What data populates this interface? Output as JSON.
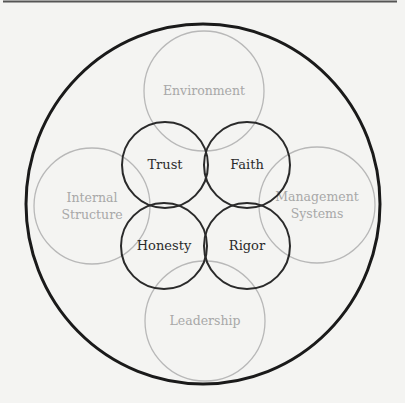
{
  "diagram": {
    "colors": {
      "background": "#f4f4f2",
      "outer_stroke": "#1a1a1a",
      "outer_label_stroke": "#b8b8b8",
      "outer_label_text": "#a8a8a8",
      "inner_stroke": "#2a2a2a",
      "inner_text": "#2a2a2a",
      "top_rule": "#555555"
    },
    "outer_ring": {
      "cx": 203,
      "cy": 204,
      "rx": 177,
      "ry": 180
    },
    "outer_circles": [
      {
        "id": "environment",
        "lines": [
          "Environment"
        ],
        "cx": 204,
        "cy": 91,
        "r": 60
      },
      {
        "id": "internal-structure",
        "lines": [
          "Internal",
          "Structure"
        ],
        "cx": 92,
        "cy": 206,
        "r": 58
      },
      {
        "id": "management-systems",
        "lines": [
          "Management",
          "Systems"
        ],
        "cx": 317,
        "cy": 205,
        "r": 58
      },
      {
        "id": "leadership",
        "lines": [
          "Leadership"
        ],
        "cx": 205,
        "cy": 321,
        "r": 60
      }
    ],
    "inner_circles": [
      {
        "id": "trust",
        "label": "Trust",
        "cx": 165,
        "cy": 165,
        "r": 43
      },
      {
        "id": "faith",
        "label": "Faith",
        "cx": 247,
        "cy": 165,
        "r": 43
      },
      {
        "id": "honesty",
        "label": "Honesty",
        "cx": 164,
        "cy": 246,
        "r": 43
      },
      {
        "id": "rigor",
        "label": "Rigor",
        "cx": 247,
        "cy": 246,
        "r": 43
      }
    ]
  }
}
